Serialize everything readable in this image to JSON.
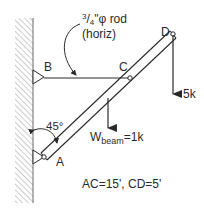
{
  "diagram": {
    "type": "structural-free-body",
    "labels": {
      "rod_label_num": "3",
      "rod_label_den": "4",
      "rod_label_rest": "\"φ rod",
      "rod_label_line2": "(horiz)",
      "point_a": "A",
      "point_b": "B",
      "point_c": "C",
      "point_d": "D",
      "angle": "45°",
      "load_d": "5k",
      "weight_main": "W",
      "weight_sub": "beam",
      "weight_value": "=1k",
      "dimensions": "AC=15', CD=5'"
    },
    "colors": {
      "line": "#2a2a2a",
      "hatch": "#9a9a9a",
      "background": "#ffffff"
    }
  }
}
